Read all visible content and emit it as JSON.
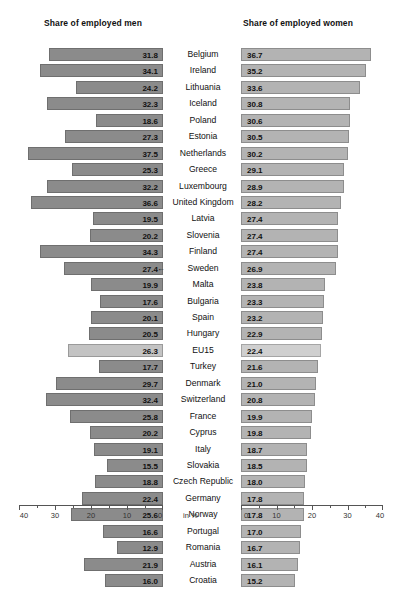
{
  "panels": {
    "left_title": "Share of employed men",
    "right_title": "Share of employed women"
  },
  "axis": {
    "unit_label": "in %",
    "left_ticks": [
      "40",
      "30",
      "20",
      "10",
      "0"
    ],
    "right_ticks": [
      "0",
      "10",
      "20",
      "30",
      "40"
    ],
    "left_range": [
      40,
      0
    ],
    "right_range": [
      0,
      40
    ],
    "tick_step": 10,
    "minor_step": 5
  },
  "marker": {
    "glyph": "←",
    "country": "Sweden"
  },
  "colors": {
    "bar_men": "#8b8b8b",
    "bar_men_border": "#6f6f6f",
    "bar_women": "#b3b3b3",
    "bar_women_border": "#8d8d8d",
    "bar_highlight_men": "#c3c3c3",
    "bar_highlight_women": "#cfcfcf",
    "text": "#111111",
    "axis": "#555555",
    "background": "#ffffff"
  },
  "chart_data": {
    "type": "bar",
    "title": "",
    "subtitle": "",
    "orientation": "horizontal",
    "layout": "butterfly/diverging paired bar chart, sorted descending by women's share",
    "xlabel": "in %",
    "ylabel": "",
    "grid": false,
    "legend_position": "none",
    "axis_left": {
      "label": "Share of employed men",
      "range": [
        40,
        0
      ],
      "direction": "reversed",
      "ticks": [
        40,
        30,
        20,
        10,
        0
      ]
    },
    "axis_right": {
      "label": "Share of employed women",
      "range": [
        0,
        40
      ],
      "direction": "normal",
      "ticks": [
        0,
        10,
        20,
        30,
        40
      ]
    },
    "categories": [
      "Belgium",
      "Ireland",
      "Lithuania",
      "Iceland",
      "Poland",
      "Estonia",
      "Netherlands",
      "Greece",
      "Luxembourg",
      "United Kingdom",
      "Latvia",
      "Slovenia",
      "Finland",
      "Sweden",
      "Malta",
      "Bulgaria",
      "Spain",
      "Hungary",
      "EU15",
      "Turkey",
      "Denmark",
      "Switzerland",
      "France",
      "Cyprus",
      "Italy",
      "Slovakia",
      "Czech Republic",
      "Germany",
      "Norway",
      "Portugal",
      "Romania",
      "Austria",
      "Croatia"
    ],
    "series": [
      {
        "name": "Share of employed men",
        "side": "left",
        "values": [
          31.8,
          34.1,
          24.2,
          32.3,
          18.6,
          27.3,
          37.5,
          25.3,
          32.2,
          36.6,
          19.5,
          20.2,
          34.3,
          27.4,
          19.9,
          17.6,
          20.1,
          20.5,
          26.3,
          17.7,
          29.7,
          32.4,
          25.8,
          20.2,
          19.1,
          15.5,
          18.8,
          22.4,
          25.6,
          16.6,
          12.9,
          21.9,
          16.0
        ]
      },
      {
        "name": "Share of employed women",
        "side": "right",
        "values": [
          36.7,
          35.2,
          33.6,
          30.8,
          30.6,
          30.5,
          30.2,
          29.1,
          28.9,
          28.2,
          27.4,
          27.4,
          27.4,
          26.9,
          23.8,
          23.3,
          23.2,
          22.9,
          22.4,
          21.6,
          21.0,
          20.8,
          19.9,
          19.8,
          18.7,
          18.5,
          18.0,
          17.8,
          17.8,
          17.0,
          16.7,
          16.1,
          15.2
        ]
      }
    ],
    "highlighted_categories": [
      "EU15"
    ],
    "annotated_categories": [
      "Sweden"
    ]
  }
}
